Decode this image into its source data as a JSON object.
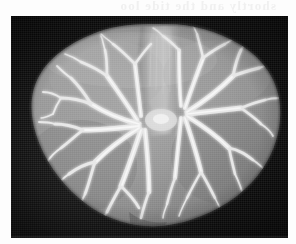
{
  "page": {
    "background_color": "#fdfdfd",
    "width": 296,
    "height": 244
  },
  "bleed_through": {
    "text": "shortly and the tide loo",
    "note": "faint mirrored show-through text from reverse of scanned page",
    "color": "#efefef"
  },
  "photograph": {
    "caption": "",
    "subject": "dissected liver specimen with corrosion-cast biliary and vascular tree",
    "background_color": "#0b0b0b",
    "tissue_color": "#8e8e8e",
    "tissue_shadow_color": "#5f5f5f",
    "tissue_highlight_color": "#b9b9b9",
    "cast_color": "#e4e4e4",
    "cast_core_color": "#f4f4f4",
    "frame": {
      "left": 11,
      "top": 16,
      "width": 277,
      "height": 222
    },
    "features": [
      {
        "name": "left-lobe",
        "label": "left hepatic lobe"
      },
      {
        "name": "right-lobe",
        "label": "right hepatic lobe"
      },
      {
        "name": "hilar-ridge",
        "label": "central hilar ridge"
      },
      {
        "name": "ductal-tree-left",
        "label": "left branching duct cast"
      },
      {
        "name": "ductal-tree-right",
        "label": "right branching duct cast"
      },
      {
        "name": "inferior-notch",
        "label": "inferior border notch"
      }
    ]
  }
}
